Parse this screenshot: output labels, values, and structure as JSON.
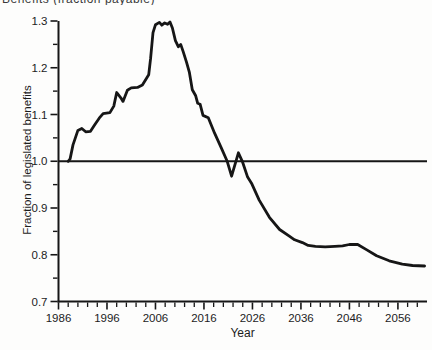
{
  "figure": {
    "top_cropped_caption": "Benefits (fraction payable)"
  },
  "chart_data": {
    "type": "line",
    "title": "",
    "xlabel": "Year",
    "ylabel": "Fraction of legislated benefits",
    "xlim": [
      1986,
      2062
    ],
    "ylim": [
      0.7,
      1.3
    ],
    "x_major_ticks": [
      1986,
      1996,
      2006,
      2016,
      2026,
      2036,
      2046,
      2056
    ],
    "x_minor_step_years": 2,
    "y_major_ticks": [
      0.7,
      0.8,
      0.9,
      1.0,
      1.1,
      1.2,
      1.3
    ],
    "y_minor_ticks": [
      0.75,
      0.85,
      0.95,
      1.05,
      1.15,
      1.25
    ],
    "reference_line_y": 1.0,
    "grid": false,
    "line_color": "#161616",
    "background_color": "#fdfdfc",
    "series": [
      {
        "name": "fraction-of-legislated-benefits",
        "points": [
          [
            1988.0,
            1.0
          ],
          [
            1988.4,
            1.005
          ],
          [
            1989.0,
            1.035
          ],
          [
            1990.0,
            1.066
          ],
          [
            1990.8,
            1.07
          ],
          [
            1991.6,
            1.063
          ],
          [
            1992.6,
            1.064
          ],
          [
            1993.4,
            1.077
          ],
          [
            1994.4,
            1.092
          ],
          [
            1995.2,
            1.102
          ],
          [
            1996.6,
            1.104
          ],
          [
            1997.4,
            1.118
          ],
          [
            1998.0,
            1.147
          ],
          [
            1998.9,
            1.135
          ],
          [
            1999.3,
            1.128
          ],
          [
            2000.2,
            1.152
          ],
          [
            2001.0,
            1.157
          ],
          [
            2002.3,
            1.158
          ],
          [
            2003.3,
            1.163
          ],
          [
            2004.2,
            1.178
          ],
          [
            2004.6,
            1.185
          ],
          [
            2005.0,
            1.22
          ],
          [
            2005.5,
            1.275
          ],
          [
            2006.0,
            1.292
          ],
          [
            2006.8,
            1.297
          ],
          [
            2007.3,
            1.291
          ],
          [
            2007.9,
            1.296
          ],
          [
            2008.5,
            1.293
          ],
          [
            2009.0,
            1.298
          ],
          [
            2009.5,
            1.285
          ],
          [
            2010.1,
            1.258
          ],
          [
            2010.7,
            1.245
          ],
          [
            2011.2,
            1.25
          ],
          [
            2011.7,
            1.235
          ],
          [
            2012.4,
            1.212
          ],
          [
            2013.0,
            1.19
          ],
          [
            2013.6,
            1.153
          ],
          [
            2014.3,
            1.14
          ],
          [
            2014.7,
            1.124
          ],
          [
            2015.2,
            1.122
          ],
          [
            2015.8,
            1.098
          ],
          [
            2016.9,
            1.093
          ],
          [
            2018.2,
            1.06
          ],
          [
            2019.6,
            1.028
          ],
          [
            2020.8,
            1.0
          ],
          [
            2021.7,
            0.968
          ],
          [
            2023.1,
            1.018
          ],
          [
            2023.9,
            1.0
          ],
          [
            2025.0,
            0.966
          ],
          [
            2025.8,
            0.953
          ],
          [
            2027.4,
            0.917
          ],
          [
            2029.5,
            0.88
          ],
          [
            2031.6,
            0.854
          ],
          [
            2033.6,
            0.84
          ],
          [
            2034.7,
            0.832
          ],
          [
            2036.3,
            0.826
          ],
          [
            2037.5,
            0.82
          ],
          [
            2039.0,
            0.818
          ],
          [
            2041.0,
            0.817
          ],
          [
            2043.0,
            0.818
          ],
          [
            2044.6,
            0.819
          ],
          [
            2046.0,
            0.822
          ],
          [
            2047.7,
            0.822
          ],
          [
            2049.5,
            0.811
          ],
          [
            2051.6,
            0.798
          ],
          [
            2054.2,
            0.787
          ],
          [
            2056.9,
            0.78
          ],
          [
            2059.0,
            0.777
          ],
          [
            2061.5,
            0.776
          ]
        ]
      }
    ]
  }
}
